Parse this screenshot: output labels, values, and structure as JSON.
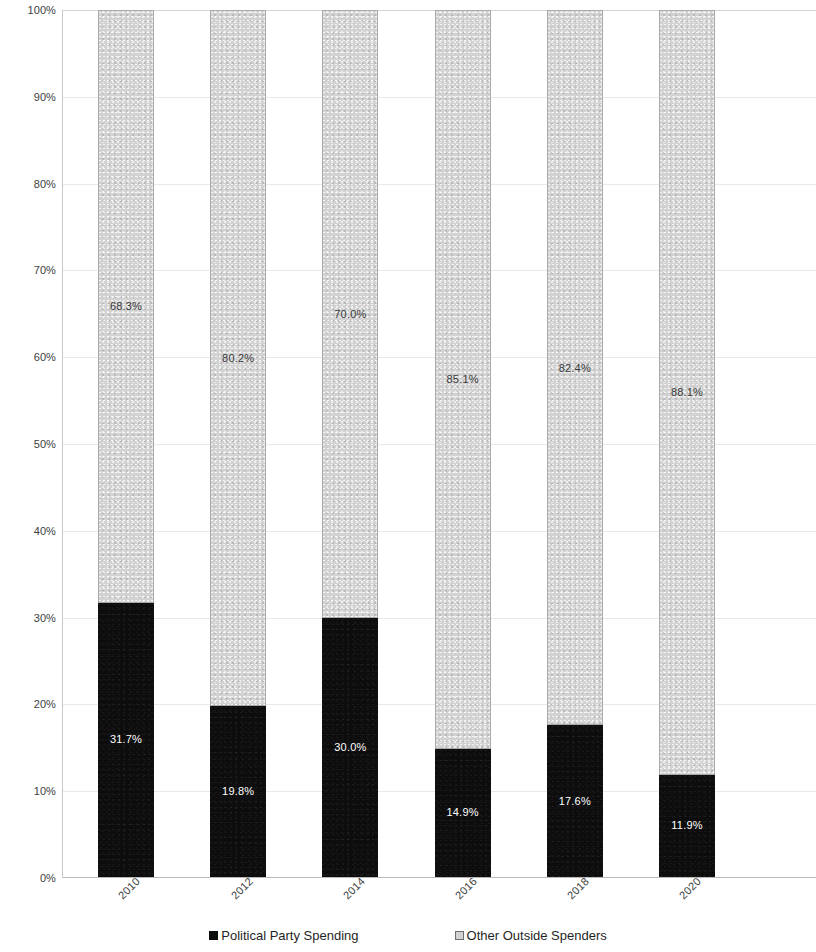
{
  "chart_data": {
    "type": "bar",
    "subtype": "100% stacked bar",
    "title": "",
    "subtitle": "",
    "xlabel": "",
    "ylabel": "",
    "categories": [
      "2010",
      "2012",
      "2014",
      "2016",
      "2018",
      "2020"
    ],
    "series": [
      {
        "name": "Political Party Spending",
        "color": "#0d0d0d",
        "values": [
          31.7,
          19.8,
          30.0,
          14.9,
          17.6,
          11.9
        ],
        "labels": [
          "31.7%",
          "19.8%",
          "30.0%",
          "14.9%",
          "17.6%",
          "11.9%"
        ]
      },
      {
        "name": "Other Outside Spenders",
        "color": "#d2d2d2",
        "values": [
          68.3,
          80.2,
          70.0,
          85.1,
          82.4,
          88.1
        ],
        "labels": [
          "68.3%",
          "80.2%",
          "70.0%",
          "85.1%",
          "82.4%",
          "88.1%"
        ]
      }
    ],
    "ylim": [
      0,
      100
    ],
    "ytick_values": [
      0,
      10,
      20,
      30,
      40,
      50,
      60,
      70,
      80,
      90,
      100
    ],
    "ytick_labels": [
      "0%",
      "10%",
      "20%",
      "30%",
      "40%",
      "50%",
      "60%",
      "70%",
      "80%",
      "90%",
      "100%"
    ],
    "grid": true,
    "grid_axis": "y",
    "legend_position": "bottom",
    "xtick_rotation": -45
  },
  "legend": {
    "items": [
      {
        "label": "Political Party Spending",
        "swatch": "filled-black-square-icon"
      },
      {
        "label": "Other Outside Spenders",
        "swatch": "outlined-gray-square-icon"
      }
    ]
  },
  "axes": {
    "y": {
      "ticks": [
        "100%",
        "90%",
        "80%",
        "70%",
        "60%",
        "50%",
        "40%",
        "30%",
        "20%",
        "10%",
        "0%"
      ]
    },
    "x": {
      "ticks": [
        "2010",
        "2012",
        "2014",
        "2016",
        "2018",
        "2020"
      ]
    }
  }
}
